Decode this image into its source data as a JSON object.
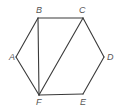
{
  "diagram": {
    "type": "geometry",
    "shape": "hexagon",
    "vertices": [
      {
        "id": "A",
        "label": "A",
        "x": 16,
        "y": 57,
        "lx": 9,
        "ly": 60
      },
      {
        "id": "B",
        "label": "B",
        "x": 38,
        "y": 18,
        "lx": 36,
        "ly": 13
      },
      {
        "id": "C",
        "label": "C",
        "x": 83,
        "y": 18,
        "lx": 79,
        "ly": 13
      },
      {
        "id": "D",
        "label": "D",
        "x": 104,
        "y": 57,
        "lx": 107,
        "ly": 60
      },
      {
        "id": "E",
        "label": "E",
        "x": 83,
        "y": 94,
        "lx": 80,
        "ly": 105
      },
      {
        "id": "F",
        "label": "F",
        "x": 39,
        "y": 95,
        "lx": 36,
        "ly": 105
      }
    ],
    "edges": [
      {
        "from": "A",
        "to": "B",
        "kind": "side"
      },
      {
        "from": "B",
        "to": "C",
        "kind": "side"
      },
      {
        "from": "C",
        "to": "D",
        "kind": "side"
      },
      {
        "from": "D",
        "to": "E",
        "kind": "side"
      },
      {
        "from": "E",
        "to": "F",
        "kind": "side"
      },
      {
        "from": "F",
        "to": "A",
        "kind": "side"
      },
      {
        "from": "B",
        "to": "F",
        "kind": "diagonal"
      },
      {
        "from": "C",
        "to": "F",
        "kind": "diagonal"
      }
    ],
    "colors": {
      "stroke": "#3a3a3a",
      "label": "#555555",
      "background": "#ffffff"
    }
  }
}
